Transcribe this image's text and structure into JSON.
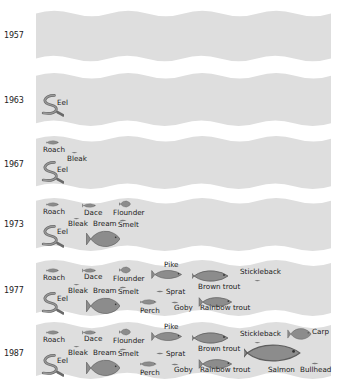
{
  "colors": {
    "band": "#dedede",
    "fish": "#8c8c8c",
    "fish_outline": "#5e5e5e",
    "text": "#1a1a1a"
  },
  "rows": [
    {
      "year": "1957",
      "species": []
    },
    {
      "year": "1963",
      "species": [
        "Eel"
      ]
    },
    {
      "year": "1967",
      "species": [
        "Roach",
        "Bleak",
        "Eel"
      ]
    },
    {
      "year": "1973",
      "species": [
        "Roach",
        "Dace",
        "Flounder",
        "Bleak",
        "Bream",
        "Smelt",
        "Eel"
      ]
    },
    {
      "year": "1977",
      "species": [
        "Roach",
        "Dace",
        "Flounder",
        "Pike",
        "Brown trout",
        "Stickleback",
        "Bleak",
        "Bream",
        "Smelt",
        "Sprat",
        "Eel",
        "Perch",
        "Goby",
        "Rainbow trout"
      ]
    },
    {
      "year": "1987",
      "species": [
        "Roach",
        "Dace",
        "Flounder",
        "Pike",
        "Brown trout",
        "Stickleback",
        "Carp",
        "Bleak",
        "Bream",
        "Smelt",
        "Sprat",
        "Eel",
        "Perch",
        "Goby",
        "Rainbow trout",
        "Salmon",
        "Bullhead"
      ]
    }
  ],
  "labels": {
    "eel": "Eel",
    "roach": "Roach",
    "bleak": "Bleak",
    "dace": "Dace",
    "flounder": "Flounder",
    "bream": "Bream",
    "smelt": "Smelt",
    "pike": "Pike",
    "brown_trout": "Brown trout",
    "stickleback": "Stickleback",
    "sprat": "Sprat",
    "perch": "Perch",
    "goby": "Goby",
    "rainbow_trout": "Rainbow trout",
    "carp": "Carp",
    "salmon": "Salmon",
    "bullhead": "Bullhead"
  }
}
